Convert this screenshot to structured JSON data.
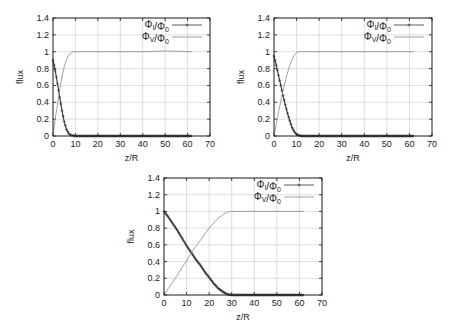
{
  "figure": {
    "legend": {
      "series_i_label": "Φ_I/Φ_0",
      "series_v_label": "Φ_V/Φ_0"
    }
  },
  "chart_data": [
    {
      "type": "line",
      "panel": "top-left",
      "title": "",
      "xlabel": "z/R",
      "ylabel": "flux",
      "xlim": [
        0,
        70
      ],
      "ylim": [
        0,
        1.4
      ],
      "xticks": [
        0,
        10,
        20,
        30,
        40,
        50,
        60,
        70
      ],
      "yticks": [
        0,
        0.2,
        0.4,
        0.6,
        0.8,
        1,
        1.2,
        1.4
      ],
      "grid": true,
      "legend_position": "top-right",
      "series": [
        {
          "name": "Φ_I/Φ_0",
          "style": "line+points",
          "x": [
            0,
            1,
            2,
            3,
            4,
            5,
            6,
            7,
            8,
            9,
            10,
            15,
            20,
            30,
            40,
            50,
            62
          ],
          "y": [
            0.9,
            0.78,
            0.62,
            0.46,
            0.3,
            0.17,
            0.08,
            0.03,
            0.01,
            0.005,
            0,
            0,
            0,
            0,
            0,
            0,
            0
          ]
        },
        {
          "name": "Φ_V/Φ_0",
          "style": "line",
          "x": [
            0,
            1,
            2,
            3,
            4,
            5,
            6,
            7,
            8,
            9,
            10,
            15,
            20,
            30,
            40,
            50,
            62
          ],
          "y": [
            0,
            0.2,
            0.38,
            0.55,
            0.7,
            0.82,
            0.91,
            0.96,
            0.99,
            1.0,
            1.0,
            1.0,
            1.0,
            1.0,
            1.0,
            1.01,
            1.0
          ]
        }
      ]
    },
    {
      "type": "line",
      "panel": "top-right",
      "title": "",
      "xlabel": "z/R",
      "ylabel": "flux",
      "xlim": [
        0,
        70
      ],
      "ylim": [
        0,
        1.4
      ],
      "xticks": [
        0,
        10,
        20,
        30,
        40,
        50,
        60,
        70
      ],
      "yticks": [
        0,
        0.2,
        0.4,
        0.6,
        0.8,
        1,
        1.2,
        1.4
      ],
      "grid": true,
      "legend_position": "top-right",
      "series": [
        {
          "name": "Φ_I/Φ_0",
          "style": "line+points",
          "x": [
            0,
            1,
            2,
            3,
            4,
            5,
            6,
            7,
            8,
            9,
            10,
            11,
            12,
            15,
            20,
            30,
            40,
            50,
            62
          ],
          "y": [
            0.95,
            0.84,
            0.72,
            0.6,
            0.48,
            0.37,
            0.27,
            0.18,
            0.1,
            0.05,
            0.02,
            0.01,
            0,
            0,
            0,
            0,
            0,
            0,
            0
          ]
        },
        {
          "name": "Φ_V/Φ_0",
          "style": "line",
          "x": [
            0,
            1,
            2,
            3,
            4,
            5,
            6,
            7,
            8,
            9,
            10,
            11,
            12,
            15,
            20,
            30,
            40,
            50,
            62
          ],
          "y": [
            0,
            0.14,
            0.28,
            0.41,
            0.54,
            0.65,
            0.75,
            0.84,
            0.91,
            0.96,
            0.99,
            1.0,
            1.0,
            1.0,
            1.0,
            1.0,
            1.0,
            1.0,
            1.0
          ]
        }
      ]
    },
    {
      "type": "line",
      "panel": "bottom-center",
      "title": "",
      "xlabel": "z/R",
      "ylabel": "flux",
      "xlim": [
        0,
        70
      ],
      "ylim": [
        0,
        1.4
      ],
      "xticks": [
        0,
        10,
        20,
        30,
        40,
        50,
        60,
        70
      ],
      "yticks": [
        0,
        0.2,
        0.4,
        0.6,
        0.8,
        1,
        1.2,
        1.4
      ],
      "grid": true,
      "legend_position": "top-right",
      "series": [
        {
          "name": "Φ_I/Φ_0",
          "style": "line+points",
          "x": [
            0,
            2,
            4,
            6,
            8,
            10,
            12,
            14,
            16,
            18,
            20,
            22,
            24,
            26,
            28,
            29,
            30,
            35,
            40,
            50,
            62
          ],
          "y": [
            1.0,
            0.93,
            0.85,
            0.77,
            0.68,
            0.59,
            0.51,
            0.43,
            0.36,
            0.28,
            0.21,
            0.14,
            0.08,
            0.04,
            0.01,
            0.005,
            0,
            0,
            0,
            0,
            0
          ]
        },
        {
          "name": "Φ_V/Φ_0",
          "style": "line",
          "x": [
            0,
            2,
            4,
            6,
            8,
            10,
            12,
            14,
            16,
            18,
            20,
            22,
            24,
            26,
            28,
            29,
            30,
            35,
            40,
            50,
            62
          ],
          "y": [
            0,
            0.08,
            0.16,
            0.24,
            0.33,
            0.41,
            0.5,
            0.58,
            0.65,
            0.73,
            0.8,
            0.86,
            0.92,
            0.96,
            0.99,
            1.0,
            1.0,
            1.0,
            1.0,
            1.0,
            1.0
          ]
        }
      ]
    }
  ],
  "layout": {
    "panels": [
      {
        "left": 53,
        "top": 18,
        "width": 157,
        "height": 118
      },
      {
        "left": 274,
        "top": 18,
        "width": 158,
        "height": 118
      },
      {
        "left": 164,
        "top": 178,
        "width": 158,
        "height": 117
      }
    ]
  },
  "colors": {
    "frame": "#1a1a1a",
    "grid": "#c8c8c8",
    "series_i": "#333333",
    "series_v": "#8a8a8a",
    "text": "#222222"
  }
}
